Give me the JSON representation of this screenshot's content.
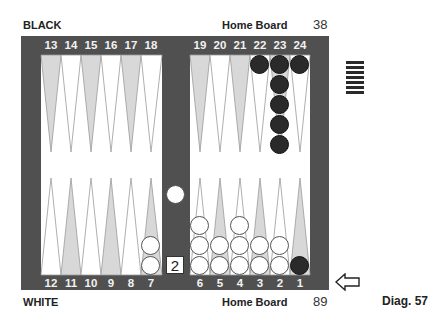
{
  "header": {
    "top_player": "BLACK",
    "top_home_label": "Home Board",
    "top_pip_count": "38",
    "bottom_player": "WHITE",
    "bottom_home_label": "Home Board",
    "bottom_pip_count": "89",
    "caption": "Diag. 57"
  },
  "board": {
    "top_points": [
      "13",
      "14",
      "15",
      "16",
      "17",
      "18",
      "19",
      "20",
      "21",
      "22",
      "23",
      "24"
    ],
    "bottom_points": [
      "12",
      "11",
      "10",
      "9",
      "8",
      "7",
      "6",
      "5",
      "4",
      "3",
      "2",
      "1"
    ],
    "colors": {
      "frame": "#505050",
      "field": "#ffffff",
      "dark_point": "#d8d8d8",
      "light_point": "#ffffff",
      "black_checker": "#2a2a2a",
      "white_checker": "#ffffff"
    },
    "position": {
      "black": [
        {
          "point": 22,
          "count": 1
        },
        {
          "point": 23,
          "count": 5
        },
        {
          "point": 24,
          "count": 1
        },
        {
          "point": 1,
          "count": 1
        }
      ],
      "white": [
        {
          "point": 7,
          "count": 2
        },
        {
          "point": 6,
          "count": 3
        },
        {
          "point": 5,
          "count": 2
        },
        {
          "point": 4,
          "count": 3
        },
        {
          "point": 3,
          "count": 2
        },
        {
          "point": 2,
          "count": 2
        }
      ],
      "white_on_bar": 1,
      "black_borne_off": 7
    },
    "cube_value": "2",
    "turn_indicator": "arrow-left-icon (White to move)"
  }
}
